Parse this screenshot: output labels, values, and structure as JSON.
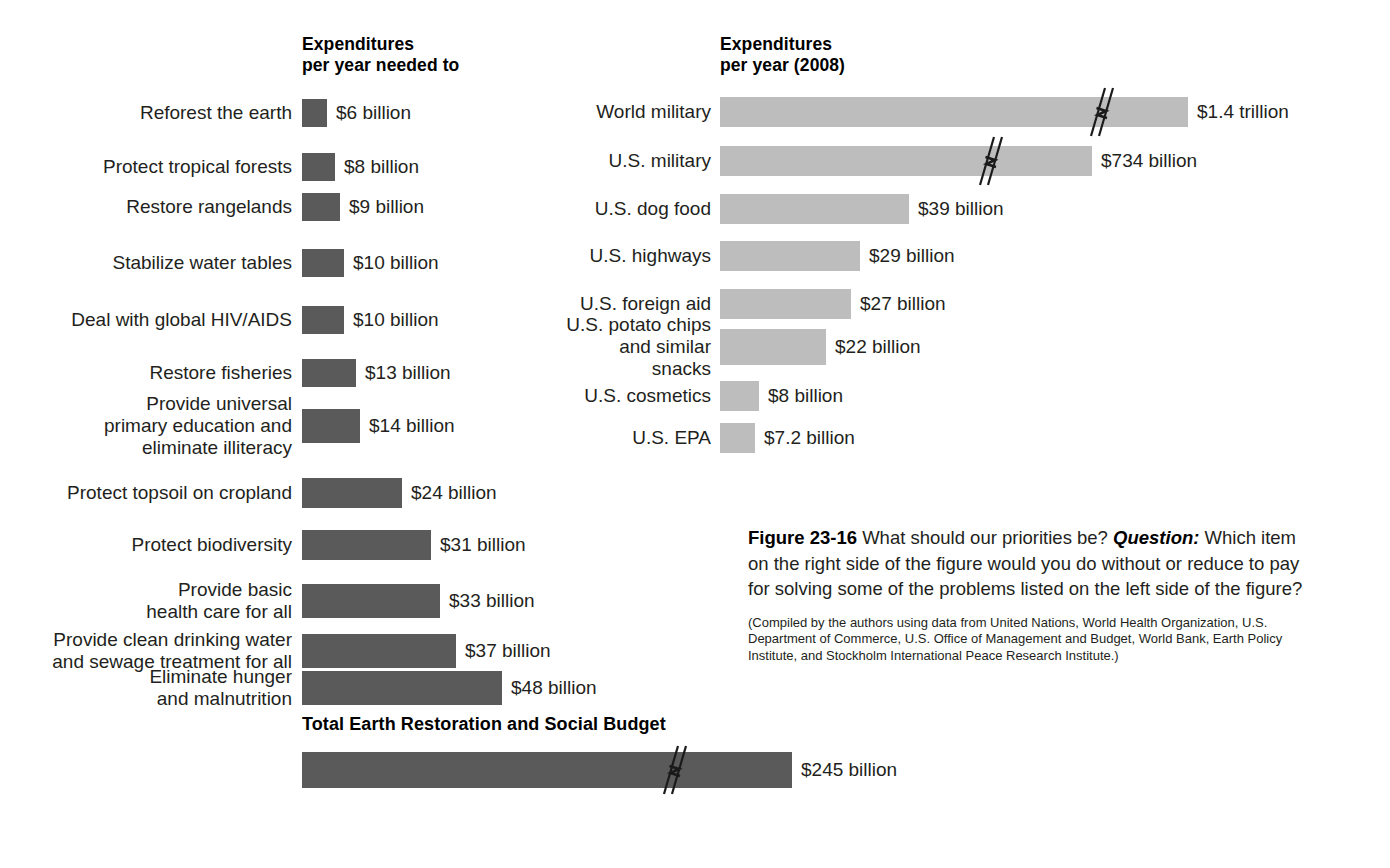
{
  "figure": {
    "number": "Figure 23-16",
    "caption_lead": "What should our priorities be?",
    "question_label": "Question:",
    "question_text": "Which item on the right side of the figure would you do without or reduce to pay for solving some of the problems listed on the left side of the figure?",
    "source_note": "(Compiled by the authors using data from United Nations, World Health Organization, U.S. Department of Commerce, U.S. Office of Management and Budget, World Bank, Earth Policy Institute, and Stockholm International Peace Research Institute.)"
  },
  "left_column": {
    "heading": "Expenditures\nper year needed to",
    "items": [
      {
        "label": "Reforest the earth",
        "value": "$6 billion",
        "amount": 6
      },
      {
        "label": "Protect tropical forests",
        "value": "$8 billion",
        "amount": 8
      },
      {
        "label": "Restore rangelands",
        "value": "$9 billion",
        "amount": 9
      },
      {
        "label": "Stabilize water tables",
        "value": "$10 billion",
        "amount": 10
      },
      {
        "label": "Deal with global HIV/AIDS",
        "value": "$10 billion",
        "amount": 10
      },
      {
        "label": "Restore fisheries",
        "value": "$13 billion",
        "amount": 13
      },
      {
        "label": "Provide universal\nprimary education and\neliminate illiteracy",
        "value": "$14 billion",
        "amount": 14
      },
      {
        "label": "Protect topsoil on cropland",
        "value": "$24 billion",
        "amount": 24
      },
      {
        "label": "Protect biodiversity",
        "value": "$31 billion",
        "amount": 31
      },
      {
        "label": "Provide basic\nhealth care for all",
        "value": "$33 billion",
        "amount": 33
      },
      {
        "label": "Provide clean drinking water\nand sewage treatment for all",
        "value": "$37 billion",
        "amount": 37
      },
      {
        "label": "Eliminate hunger\nand malnutrition",
        "value": "$48 billion",
        "amount": 48
      }
    ]
  },
  "right_column": {
    "heading": "Expenditures\nper year (2008)",
    "items": [
      {
        "label": "World military",
        "value": "$1.4 trillion",
        "amount": 1400,
        "broken": true
      },
      {
        "label": "U.S. military",
        "value": "$734 billion",
        "amount": 734,
        "broken": true
      },
      {
        "label": "U.S. dog food",
        "value": "$39 billion",
        "amount": 39,
        "broken": false
      },
      {
        "label": "U.S. highways",
        "value": "$29 billion",
        "amount": 29,
        "broken": false
      },
      {
        "label": "U.S. foreign aid",
        "value": "$27 billion",
        "amount": 27,
        "broken": false
      },
      {
        "label": "U.S. potato chips\nand similar snacks",
        "value": "$22 billion",
        "amount": 22,
        "broken": false
      },
      {
        "label": "U.S. cosmetics",
        "value": "$8 billion",
        "amount": 8,
        "broken": false
      },
      {
        "label": "U.S. EPA",
        "value": "$7.2 billion",
        "amount": 7.2,
        "broken": false
      }
    ]
  },
  "total": {
    "title": "Total Earth Restoration and Social Budget",
    "value": "$245 billion",
    "amount": 245,
    "broken": true
  },
  "colors": {
    "bar_dark": "#5a5a5a",
    "bar_light": "#bdbdbd",
    "text": "#231f20",
    "background": "#ffffff"
  },
  "chart_data": {
    "type": "bar",
    "title": "What should our priorities be?",
    "orientation": "horizontal",
    "grid": false,
    "legend": "none",
    "xlabel": "",
    "ylabel": "",
    "units": "US dollars per year",
    "series": [
      {
        "name": "Expenditures per year needed to",
        "color": "#5a5a5a",
        "categories": [
          "Reforest the earth",
          "Protect tropical forests",
          "Restore rangelands",
          "Stabilize water tables",
          "Deal with global HIV/AIDS",
          "Restore fisheries",
          "Provide universal primary education and eliminate illiteracy",
          "Protect topsoil on cropland",
          "Protect biodiversity",
          "Provide basic health care for all",
          "Provide clean drinking water and sewage treatment for all",
          "Eliminate hunger and malnutrition"
        ],
        "values": [
          6,
          8,
          9,
          10,
          10,
          13,
          14,
          24,
          31,
          33,
          37,
          48
        ],
        "labels": [
          "$6 billion",
          "$8 billion",
          "$9 billion",
          "$10 billion",
          "$10 billion",
          "$13 billion",
          "$14 billion",
          "$24 billion",
          "$31 billion",
          "$33 billion",
          "$37 billion",
          "$48 billion"
        ]
      },
      {
        "name": "Expenditures per year (2008)",
        "color": "#bdbdbd",
        "categories": [
          "World military",
          "U.S. military",
          "U.S. dog food",
          "U.S. highways",
          "U.S. foreign aid",
          "U.S. potato chips and similar snacks",
          "U.S. cosmetics",
          "U.S. EPA"
        ],
        "values": [
          1400,
          734,
          39,
          29,
          27,
          22,
          8,
          7.2
        ],
        "labels": [
          "$1.4 trillion",
          "$734 billion",
          "$39 billion",
          "$29 billion",
          "$27 billion",
          "$22 billion",
          "$8 billion",
          "$7.2 billion"
        ],
        "axis_breaks": [
          "World military",
          "U.S. military"
        ]
      },
      {
        "name": "Total Earth Restoration and Social Budget",
        "color": "#5a5a5a",
        "categories": [
          "Total Earth Restoration and Social Budget"
        ],
        "values": [
          245
        ],
        "labels": [
          "$245 billion"
        ],
        "axis_breaks": [
          "Total Earth Restoration and Social Budget"
        ]
      }
    ]
  }
}
